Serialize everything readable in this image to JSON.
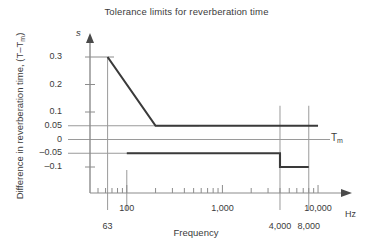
{
  "chart_data": {
    "type": "line",
    "title": "Tolerance limits for reverberation time",
    "xlabel": "Frequency",
    "ylabel": "Difference in reverberation time, (T–Tm)",
    "ylabel_main": "Difference in reverberation time, (T–T",
    "ylabel_sub": "m",
    "ylabel_tail": ")",
    "x_unit": "Hz",
    "y_unit": "s",
    "x_scale": "log",
    "xlim": [
      50,
      11000
    ],
    "ylim": [
      -0.13,
      0.33
    ],
    "grid": true,
    "legend": "none",
    "y_ticks": [
      {
        "value": 0.3,
        "label": "0.3",
        "gridline": false
      },
      {
        "value": 0.2,
        "label": "0.2",
        "gridline": false
      },
      {
        "value": 0.1,
        "label": "0.1",
        "gridline": false
      },
      {
        "value": 0.05,
        "label": "0.05",
        "gridline": true
      },
      {
        "value": 0,
        "label": "0",
        "gridline": true
      },
      {
        "value": -0.05,
        "label": "–0.05",
        "gridline": true
      },
      {
        "value": -0.1,
        "label": "–0.1",
        "gridline": false
      }
    ],
    "x_ticks_upper": [
      {
        "value": 100,
        "label": "100"
      },
      {
        "value": 1000,
        "label": "1,000"
      },
      {
        "value": 10000,
        "label": "10,000"
      }
    ],
    "x_ticks_lower": [
      {
        "value": 63,
        "label": "63"
      },
      {
        "value": 4000,
        "label": "4,000"
      },
      {
        "value": 8000,
        "label": "8,000"
      }
    ],
    "vertical_gridlines": [
      63,
      100,
      4000,
      8000
    ],
    "reference_line": {
      "value": 0,
      "label": "Tm",
      "label_main": "T",
      "label_sub": "m"
    },
    "series": [
      {
        "name": "Upper tolerance limit",
        "color": "#3a3a3a",
        "points": [
          {
            "x": 63,
            "y": 0.3
          },
          {
            "x": 200,
            "y": 0.05
          },
          {
            "x": 10000,
            "y": 0.05
          }
        ]
      },
      {
        "name": "Lower tolerance limit",
        "color": "#3a3a3a",
        "points": [
          {
            "x": 100,
            "y": -0.05
          },
          {
            "x": 4000,
            "y": -0.05
          },
          {
            "x": 4000,
            "y": -0.1
          },
          {
            "x": 8000,
            "y": -0.1
          }
        ]
      }
    ]
  }
}
